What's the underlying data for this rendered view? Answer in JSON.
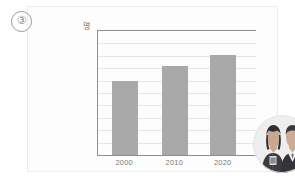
{
  "marker": {
    "label": "③"
  },
  "chart_data": {
    "type": "bar",
    "title": "",
    "xlabel": "",
    "ylabel": "명",
    "categories": [
      "2000",
      "2010",
      "2020"
    ],
    "values": [
      60,
      72,
      81
    ],
    "ylim": [
      0,
      100
    ],
    "grid": true,
    "gridline_count": 10,
    "legend": "none",
    "series": [
      {
        "name": "명",
        "values": [
          60,
          72,
          81
        ]
      }
    ],
    "bar_color": "#a9a9a9",
    "axis_color": "#8e8e8e",
    "grid_color": "#e6e6e6"
  },
  "photo": {
    "alt": "two-people-business-attire-photo",
    "shape": "circle"
  },
  "colors": {
    "card_background": "#fdfdfd",
    "card_border": "#ececec",
    "page_background": "#ffffff",
    "text": "#7a7a7a"
  }
}
